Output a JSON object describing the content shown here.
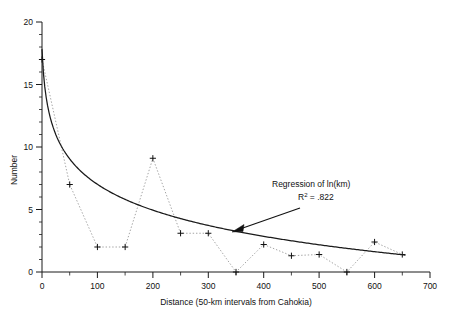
{
  "chart_data": {
    "type": "line",
    "title": "",
    "xlabel": "Distance (50-km intervals from Cahokia)",
    "ylabel": "Number",
    "xlim": [
      0,
      700
    ],
    "ylim": [
      0,
      20
    ],
    "xticks": [
      0,
      100,
      200,
      300,
      400,
      500,
      600,
      700
    ],
    "yticks": [
      0,
      5,
      10,
      15,
      20
    ],
    "xtick_labels": [
      "0",
      "100",
      "200",
      "300",
      "400",
      "500",
      "600",
      "700"
    ],
    "ytick_labels": [
      "0",
      "5",
      "10",
      "15",
      "20"
    ],
    "minor_tick_interval_x": 50,
    "minor_tick_interval_y": 1,
    "grid": false,
    "legend": "none",
    "x": [
      0,
      50,
      100,
      150,
      200,
      250,
      300,
      350,
      400,
      450,
      500,
      550,
      600,
      650
    ],
    "series": [
      {
        "name": "Number of sites",
        "style": "dotted-with-plus-markers",
        "marker": "plus",
        "color": "#9a9a9a",
        "values": [
          17.0,
          7.0,
          2.0,
          2.0,
          9.1,
          3.1,
          3.1,
          0.0,
          2.2,
          1.3,
          1.4,
          0.0,
          2.4,
          1.4
        ]
      },
      {
        "name": "Regression of ln(km)",
        "style": "solid-curve",
        "color": "#1a1a1a",
        "values": [
          17.6,
          7.1,
          5.4,
          4.4,
          3.8,
          3.2,
          2.8,
          2.4,
          2.1,
          1.8,
          1.5,
          1.3,
          1.1,
          0.85
        ]
      }
    ],
    "annotations": [
      {
        "name": "regression-annotation",
        "line1": "Regression of ln(km)",
        "line2_prefix": "R",
        "line2_sup": "2",
        "line2_suffix": " = .822",
        "arrow": "points down-left to regression curve"
      }
    ]
  },
  "axes": {
    "y_title": "Number",
    "x_title": "Distance (50-km intervals from Cahokia)"
  },
  "annotation": {
    "title": "Regression of ln(km)",
    "r_symbol": "R",
    "r_exponent": "2",
    "r_value": " = .822"
  }
}
